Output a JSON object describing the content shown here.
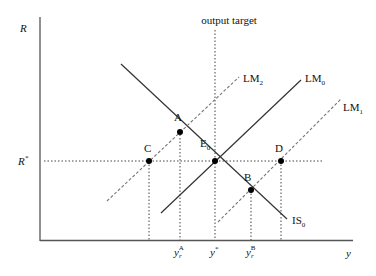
{
  "diagram": {
    "title": "output target",
    "axes": {
      "y_label": "R",
      "x_label": "y",
      "r_star_label": "R",
      "r_star_sup": "*"
    },
    "curves": {
      "is0": {
        "label": "IS",
        "sub": "0"
      },
      "lm0": {
        "label": "LM",
        "sub": "0"
      },
      "lm1": {
        "label": "LM",
        "sub": "1"
      },
      "lm2": {
        "label": "LM",
        "sub": "2"
      }
    },
    "points": {
      "A": "A",
      "B": "B",
      "C": "C",
      "D": "D",
      "E0": {
        "label": "E",
        "sub": "0"
      }
    },
    "ticks": {
      "yA": {
        "base": "y",
        "sub": "r",
        "sup": "A"
      },
      "ystar": {
        "base": "y",
        "sup": "*"
      },
      "yB": {
        "base": "y",
        "sub": "r",
        "sup": "B"
      }
    },
    "colors": {
      "axis": "#555555",
      "line": "#333333",
      "dashed": "#777777",
      "dot": "#000000"
    }
  }
}
